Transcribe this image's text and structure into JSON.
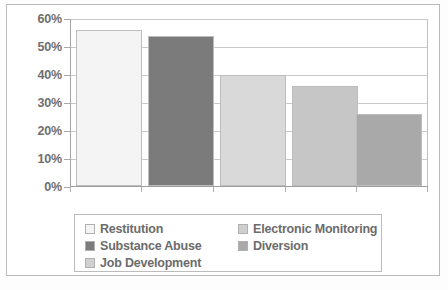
{
  "chart_data": {
    "type": "bar",
    "title": "",
    "xlabel": "",
    "ylabel": "",
    "categories": [
      "Restitution",
      "Substance Abuse",
      "Electronic Monitoring",
      "Diversion",
      "Job Development"
    ],
    "values": [
      56,
      54,
      40,
      36,
      26
    ],
    "value_labels": [
      "56%",
      "54%",
      "40%",
      "36%",
      "26%"
    ],
    "ylim": [
      0,
      60
    ],
    "yticks": [
      60,
      50,
      40,
      30,
      20,
      10,
      0
    ],
    "ytick_labels": [
      "60%",
      "50%",
      "40%",
      "30%",
      "20%",
      "10%",
      "0%"
    ],
    "grid": true,
    "grid_axis": "y",
    "legend_position": "bottom",
    "bar_colors": [
      "#f4f4f4",
      "#7b7b7b",
      "#d9d9d9",
      "#c6c6c6",
      "#a9a9a9"
    ],
    "bar_edge_color": "#bdbdbd",
    "series": [
      {
        "name": "Percent",
        "points": [
          {
            "label": "Restitution",
            "value": 56,
            "color": "#f4f4f4"
          },
          {
            "label": "Substance Abuse",
            "value": 54,
            "color": "#7b7b7b"
          },
          {
            "label": "Electronic Monitoring",
            "value": 40,
            "color": "#d9d9d9"
          },
          {
            "label": "Diversion",
            "value": 36,
            "color": "#c6c6c6"
          },
          {
            "label": "Job Development",
            "value": 26,
            "color": "#a9a9a9"
          }
        ]
      }
    ]
  },
  "legend": {
    "columns": [
      {
        "items": [
          {
            "label": "Restitution",
            "color": "#f4f4f4"
          },
          {
            "label": "Substance Abuse",
            "color": "#7b7b7b"
          },
          {
            "label": "Job Development",
            "color": "#d0d0d0"
          }
        ]
      },
      {
        "items": [
          {
            "label": "Electronic Monitoring",
            "color": "#cfcfcf"
          },
          {
            "label": "Diversion",
            "color": "#aaaaaa"
          }
        ]
      }
    ]
  },
  "colors": {
    "axis": "#a4a4a4",
    "grid": "#c9c9c9",
    "frame": "#b9b9b9",
    "text": "#6c6c6c",
    "background": "#ffffff"
  }
}
